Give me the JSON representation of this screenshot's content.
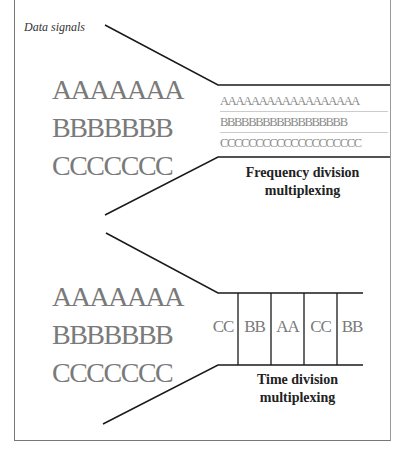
{
  "caption": "Data signals",
  "input_signals": {
    "a": "AAAAAAA",
    "b": "BBBBBBB",
    "c": "CCCCCCC"
  },
  "fdm": {
    "rows": [
      "AAAAAAAAAAAAAAAAAA",
      "BBBBBBBBBBBBBBBBBB",
      "CCCCCCCCCCCCCCCCCCCC"
    ],
    "label_line1": "Frequency division",
    "label_line2": "multiplexing"
  },
  "tdm": {
    "slots": [
      "CC",
      "BB",
      "AA",
      "CC",
      "BB"
    ],
    "label_line1": "Time division",
    "label_line2": "multiplexing"
  },
  "colors": {
    "line": "#1a1a1a",
    "signal_text": "#7a7a7a",
    "label_text": "#222222"
  }
}
